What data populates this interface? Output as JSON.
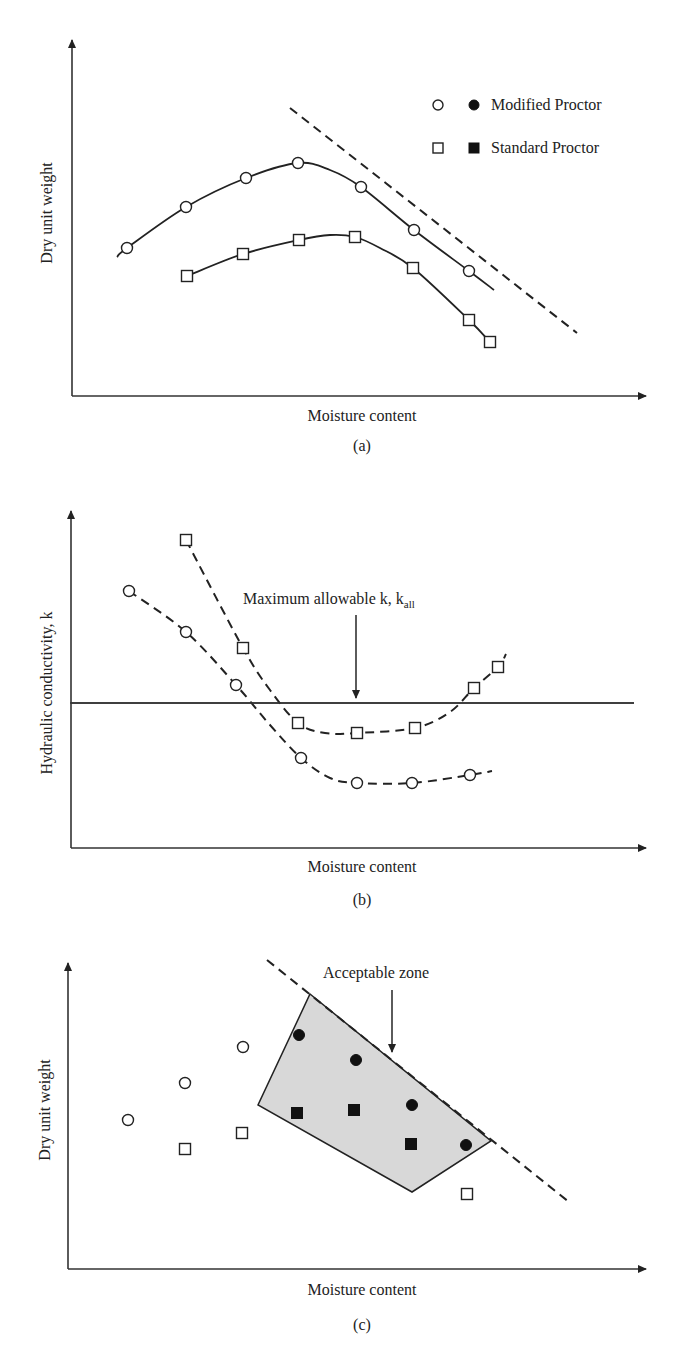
{
  "colors": {
    "ink": "#222222",
    "zone_fill": "#d8d8d8",
    "background": "#ffffff"
  },
  "legend": {
    "modified": "Modified Proctor",
    "standard": "Standard Proctor"
  },
  "panels": {
    "a": {
      "caption": "(a)",
      "xlabel": "Moisture content",
      "ylabel": "Dry unit weight"
    },
    "b": {
      "caption": "(b)",
      "xlabel": "Moisture content",
      "ylabel": "Hydraulic conductivity, k",
      "annotation": "Maximum allowable k, k",
      "annotation_sub": "all"
    },
    "c": {
      "caption": "(c)",
      "xlabel": "Moisture content",
      "ylabel": "Dry unit weight",
      "annotation": "Acceptable zone"
    }
  },
  "chart_data": [
    {
      "panel": "a",
      "type": "line",
      "title": "",
      "xlabel": "Moisture content",
      "ylabel": "Dry unit weight",
      "grid": false,
      "legend_position": "upper right",
      "legend": [
        "Modified Proctor (open/filled circle)",
        "Standard Proctor (open/filled square)"
      ],
      "axis_ticks": "none (qualitative)",
      "series": [
        {
          "name": "Modified Proctor",
          "marker": "open-circle",
          "line": "solid",
          "points": [
            [
              127,
              248
            ],
            [
              186,
              207
            ],
            [
              246,
              178
            ],
            [
              298,
              163
            ],
            [
              361,
              187
            ],
            [
              414,
              230
            ],
            [
              469,
              271
            ]
          ],
          "line_path": [
            [
              117,
              257
            ],
            [
              127,
              248
            ],
            [
              186,
              207
            ],
            [
              246,
              178
            ],
            [
              298,
              163
            ],
            [
              330,
              170
            ],
            [
              361,
              187
            ],
            [
              414,
              230
            ],
            [
              469,
              271
            ],
            [
              494,
              290
            ]
          ]
        },
        {
          "name": "Standard Proctor",
          "marker": "open-square",
          "line": "solid",
          "points": [
            [
              187,
              276
            ],
            [
              243,
              254
            ],
            [
              299,
              240
            ],
            [
              355,
              237
            ],
            [
              413,
              268
            ],
            [
              469,
              320
            ],
            [
              490,
              342
            ]
          ],
          "line_path": [
            [
              187,
              276
            ],
            [
              243,
              254
            ],
            [
              299,
              240
            ],
            [
              330,
              235
            ],
            [
              355,
              237
            ],
            [
              380,
              248
            ],
            [
              413,
              268
            ],
            [
              469,
              320
            ],
            [
              490,
              342
            ]
          ]
        },
        {
          "name": "Zero-air-voids line",
          "marker": "none",
          "line": "dashed",
          "line_path": [
            [
              290,
              108
            ],
            [
              577,
              333
            ]
          ]
        }
      ]
    },
    {
      "panel": "b",
      "type": "line",
      "title": "",
      "xlabel": "Moisture content",
      "ylabel": "Hydraulic conductivity, k",
      "grid": false,
      "annotations": [
        "Maximum allowable k, k_all (horizontal line with arrow)"
      ],
      "series": [
        {
          "name": "Modified Proctor",
          "marker": "open-circle",
          "line": "dashed",
          "points": [
            [
              129,
              591
            ],
            [
              186,
              632
            ],
            [
              236,
              685
            ],
            [
              301,
              758
            ],
            [
              357,
              783
            ],
            [
              412,
              783
            ],
            [
              470,
              775
            ]
          ],
          "line_path": [
            [
              129,
              591
            ],
            [
              186,
              632
            ],
            [
              236,
              685
            ],
            [
              270,
              725
            ],
            [
              301,
              758
            ],
            [
              330,
              778
            ],
            [
              357,
              783
            ],
            [
              412,
              783
            ],
            [
              470,
              775
            ],
            [
              492,
              771
            ]
          ]
        },
        {
          "name": "Standard Proctor",
          "marker": "open-square",
          "line": "dashed",
          "points": [
            [
              186,
              540
            ],
            [
              243,
              648
            ],
            [
              298,
              723
            ],
            [
              357,
              733
            ],
            [
              415,
              728
            ],
            [
              474,
              688
            ],
            [
              498,
              667
            ]
          ],
          "line_path": [
            [
              186,
              540
            ],
            [
              243,
              648
            ],
            [
              270,
              690
            ],
            [
              298,
              723
            ],
            [
              325,
              733
            ],
            [
              357,
              733
            ],
            [
              415,
              728
            ],
            [
              450,
              712
            ],
            [
              474,
              688
            ],
            [
              498,
              667
            ],
            [
              506,
              654
            ]
          ]
        },
        {
          "name": "Maximum allowable k",
          "marker": "none",
          "line": "solid",
          "line_path": [
            [
              70,
              703
            ],
            [
              634,
              703
            ]
          ]
        }
      ]
    },
    {
      "panel": "c",
      "type": "scatter",
      "title": "",
      "xlabel": "Moisture content",
      "ylabel": "Dry unit weight",
      "grid": false,
      "annotations": [
        "Acceptable zone (shaded polygon)"
      ],
      "series": [
        {
          "name": "Modified Proctor (fails)",
          "marker": "open-circle",
          "points": [
            [
              128,
              1120
            ],
            [
              185,
              1083
            ],
            [
              243,
              1047
            ]
          ]
        },
        {
          "name": "Modified Proctor (passes)",
          "marker": "filled-circle",
          "points": [
            [
              299,
              1035
            ],
            [
              356,
              1060
            ],
            [
              412,
              1105
            ],
            [
              466,
              1145
            ]
          ]
        },
        {
          "name": "Standard Proctor (fails)",
          "marker": "open-square",
          "points": [
            [
              185,
              1149
            ],
            [
              242,
              1133
            ],
            [
              467,
              1194
            ]
          ]
        },
        {
          "name": "Standard Proctor (passes)",
          "marker": "filled-square",
          "points": [
            [
              297,
              1113
            ],
            [
              354,
              1110
            ],
            [
              411,
              1144
            ]
          ]
        },
        {
          "name": "Zero-air-voids line",
          "marker": "none",
          "line": "dashed",
          "line_path": [
            [
              267,
              960
            ],
            [
              569,
              1202
            ]
          ]
        }
      ],
      "zone_polygon": [
        [
          310,
          994
        ],
        [
          491,
          1141
        ],
        [
          412,
          1192
        ],
        [
          258,
          1105
        ]
      ]
    }
  ]
}
